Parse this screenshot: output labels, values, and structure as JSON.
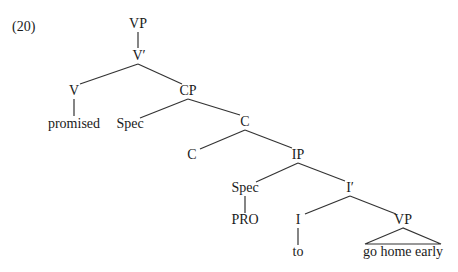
{
  "example_number": "(20)",
  "tree": {
    "nodes": {
      "vp_top": "VP",
      "v_bar": "V′",
      "v": "V",
      "promised": "promised",
      "cp": "CP",
      "spec_cp": "Spec",
      "c_bar": "C",
      "c_head": "C",
      "ip": "IP",
      "spec_ip": "Spec",
      "pro": "PRO",
      "i_bar": "I′",
      "i_head": "I",
      "to": "to",
      "vp_low": "VP",
      "go_home_early": "go home early"
    },
    "line_color": "#333333"
  }
}
